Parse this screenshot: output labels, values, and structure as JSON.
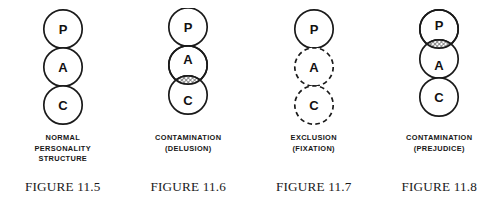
{
  "page": {
    "background_color": "#ffffff",
    "ink_color": "#1a1a1a",
    "hatch_color": "#6e6e6e"
  },
  "figures": [
    {
      "id": "figure-11-5",
      "caption": "NORMAL\nPERSONALITY\nSTRUCTURE",
      "label": "FIGURE 11.5",
      "circles": [
        {
          "letter": "P",
          "style": "solid"
        },
        {
          "letter": "A",
          "style": "solid"
        },
        {
          "letter": "C",
          "style": "solid"
        }
      ],
      "overlap": "none"
    },
    {
      "id": "figure-11-6",
      "caption": "CONTAMINATION\n(DELUSION)",
      "label": "FIGURE 11.6",
      "circles": [
        {
          "letter": "P",
          "style": "solid"
        },
        {
          "letter": "A",
          "style": "solid"
        },
        {
          "letter": "C",
          "style": "solid"
        }
      ],
      "overlap": "adult-child"
    },
    {
      "id": "figure-11-7",
      "caption": "EXCLUSION\n(FIXATION)",
      "label": "FIGURE 11.7",
      "circles": [
        {
          "letter": "P",
          "style": "solid"
        },
        {
          "letter": "A",
          "style": "dashed"
        },
        {
          "letter": "C",
          "style": "dashed"
        }
      ],
      "overlap": "none"
    },
    {
      "id": "figure-11-8",
      "caption": "CONTAMINATION\n(PREJUDICE)",
      "label": "FIGURE 11.8",
      "circles": [
        {
          "letter": "P",
          "style": "solid"
        },
        {
          "letter": "A",
          "style": "solid"
        },
        {
          "letter": "C",
          "style": "solid"
        }
      ],
      "overlap": "parent-adult"
    }
  ]
}
